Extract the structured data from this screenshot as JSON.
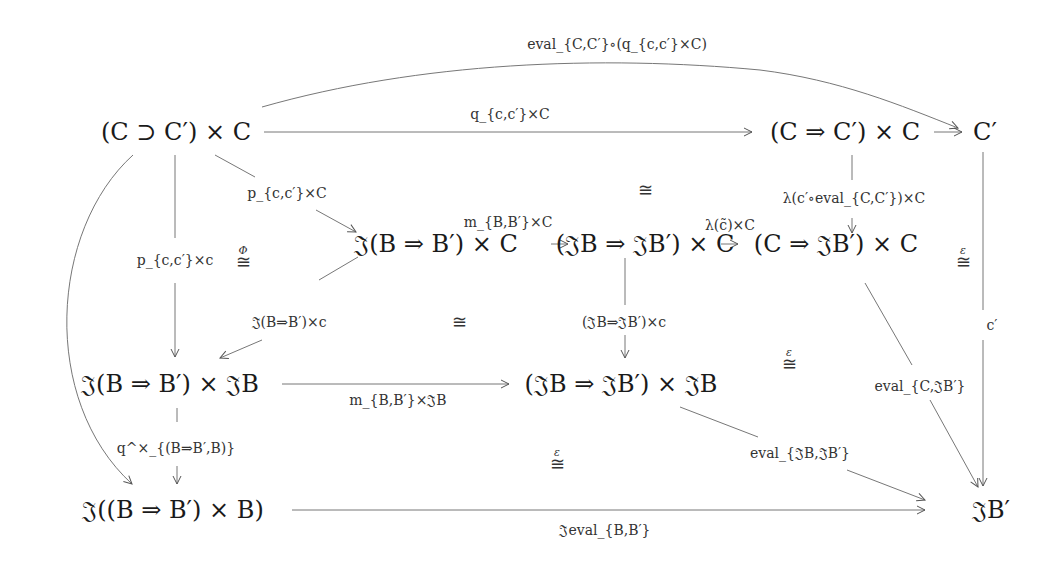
{
  "diagram": {
    "type": "commutative-diagram",
    "nodes": {
      "n1": "(C ⊃ C′) × C",
      "n2": "(C ⇒ C′) × C",
      "n3": "C′",
      "n4": "𝔍(B ⇒ B′) × C",
      "n5": "(𝔍B ⇒ 𝔍B′) × C",
      "n6": "(C ⇒ 𝔍B′) × C",
      "n7": "𝔍(B ⇒ B′) × 𝔍B",
      "n8": "(𝔍B ⇒ 𝔍B′) × 𝔍B",
      "n9": "𝔍((B ⇒ B′) × B)",
      "n10": "𝔍B′"
    },
    "arrows": {
      "top_curve": "eval_{C,C′}∘(q_{c,c′}×C)",
      "n1_n2": "q_{c,c′}×C",
      "n1_n4": "p_{c,c′}×C",
      "n1_n7": "p_{c,c′}×c",
      "n2_n6": "λ(c′∘eval_{C,C′})×C",
      "n3_n10": "c′",
      "n4_n5": "m_{B,B′}×C",
      "n5_n6": "λ(c̃)×C",
      "n4_n7": "𝔍(B⇒B′)×c",
      "n5_n8": "(𝔍B⇒𝔍B′)×c",
      "n6_n10": "eval_{C,𝔍B′}",
      "n7_n8": "m_{B,B′}×𝔍B",
      "n7_n9": "q^×_{(B⇒B′,B)}",
      "n8_n10": "eval_{𝔍B,𝔍B′}",
      "n9_n10": "𝔍eval_{B,B′}"
    },
    "isos": {
      "iso_phi": {
        "symbol": "≅",
        "superscript": "Φ"
      },
      "iso_top": {
        "symbol": "≅",
        "superscript": ""
      },
      "iso_mid": {
        "symbol": "≅",
        "superscript": ""
      },
      "iso_right": {
        "symbol": "≅",
        "superscript": "ε"
      },
      "iso_center_right": {
        "symbol": "≅",
        "superscript": "ε"
      },
      "iso_bottom": {
        "symbol": "≅",
        "superscript": "ε"
      }
    }
  }
}
